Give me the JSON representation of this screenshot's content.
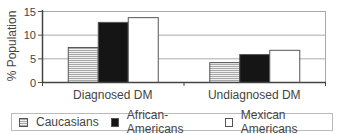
{
  "chart_data": {
    "type": "bar",
    "title": "",
    "xlabel": "",
    "ylabel": "% Population",
    "ylim": [
      0,
      15
    ],
    "yticks": [
      0,
      5,
      10,
      15
    ],
    "grid": true,
    "legend_position": "bottom",
    "categories": [
      "Diagnosed DM",
      "Undiagnosed DM"
    ],
    "series": [
      {
        "name": "Caucasians",
        "fill": "horizontal-stripes",
        "values": [
          7.4,
          4.2
        ]
      },
      {
        "name": "African-Americans",
        "fill": "#151515",
        "values": [
          12.7,
          5.9
        ]
      },
      {
        "name": "Mexican Americans",
        "fill": "#ffffff",
        "values": [
          13.7,
          6.8
        ]
      }
    ]
  },
  "axis": {
    "ylabel": "% Population",
    "ytick_labels": [
      "0",
      "5",
      "10",
      "15"
    ]
  },
  "legend": {
    "items": [
      {
        "label": "Caucasians"
      },
      {
        "label": "African-Americans"
      },
      {
        "label": "Mexican Americans"
      }
    ]
  }
}
